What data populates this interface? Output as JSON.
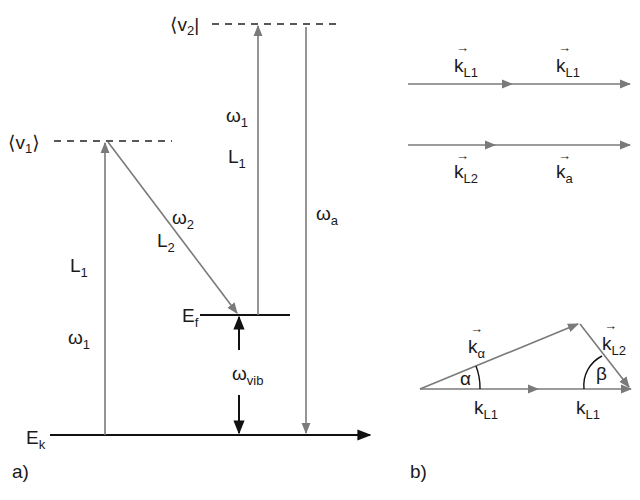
{
  "panel_a": {
    "caption": "a)",
    "levels": {
      "v1": {
        "label": "v",
        "sub": "1",
        "bra_left": "⟨",
        "ket_right": "⟩"
      },
      "v2": {
        "label": "v",
        "sub": "2",
        "bra_left": "⟨",
        "bar": "|"
      },
      "Ef": {
        "label": "E",
        "sub": "f"
      },
      "Ek": {
        "label": "E",
        "sub": "k"
      }
    },
    "transitions": {
      "left_up": {
        "laser": "L",
        "laser_sub": "1",
        "freq": "ω",
        "freq_sub": "1"
      },
      "diag_down": {
        "laser": "L",
        "laser_sub": "2",
        "freq": "ω",
        "freq_sub": "2"
      },
      "right_up": {
        "laser": "L",
        "laser_sub": "1",
        "freq": "ω",
        "freq_sub": "1"
      },
      "right_down": {
        "freq": "ω",
        "freq_sub": "a"
      },
      "vib": {
        "freq": "ω",
        "freq_sub": "vib"
      }
    }
  },
  "panel_b": {
    "caption": "b)",
    "row1": [
      {
        "label": "k",
        "sub": "L1",
        "arrow": "→"
      },
      {
        "label": "k",
        "sub": "L1",
        "arrow": "→"
      }
    ],
    "row2": [
      {
        "label": "k",
        "sub": "L2",
        "arrow": "→"
      },
      {
        "label": "k",
        "sub": "a",
        "arrow": "→"
      }
    ],
    "triangle": {
      "hyp": {
        "label": "k",
        "sub": "α",
        "arrow": "→"
      },
      "side": {
        "label": "k",
        "sub": "L2",
        "arrow": "→"
      },
      "base_left": {
        "label": "k",
        "sub": "L1"
      },
      "base_right": {
        "label": "k",
        "sub": "L1"
      },
      "angle_left": "α",
      "angle_right": "β"
    }
  },
  "colors": {
    "gray_arrow": "#7a7a7a",
    "black_arrow": "#111111"
  }
}
